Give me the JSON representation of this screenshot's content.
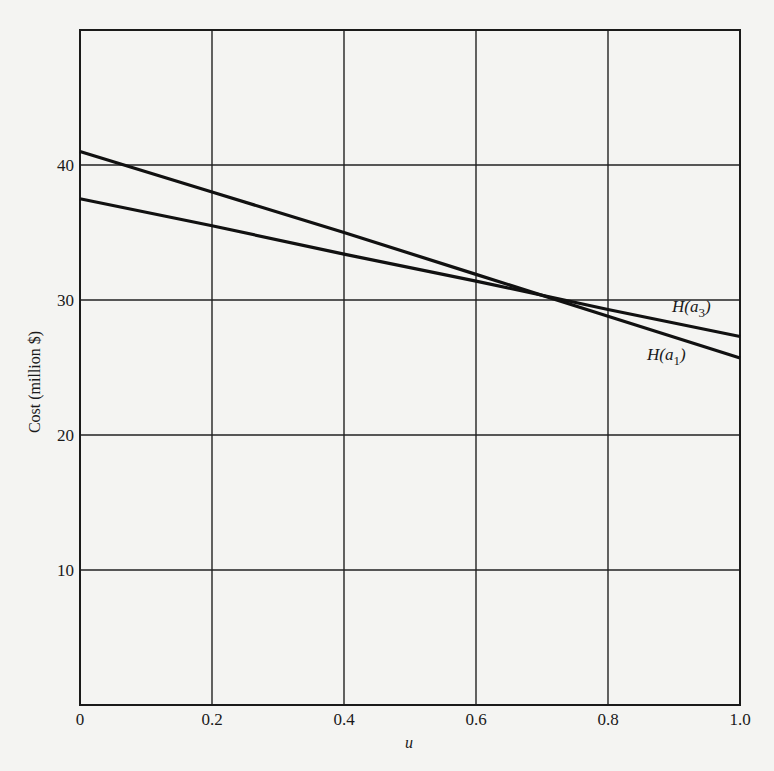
{
  "chart_data": {
    "type": "line",
    "title": "",
    "xlabel": "u",
    "ylabel": "Cost (million $)",
    "xlim": [
      0,
      1.0
    ],
    "ylim": [
      0,
      50
    ],
    "grid": true,
    "x_ticks": [
      "0",
      "0.2",
      "0.4",
      "0.6",
      "0.8",
      "1.0"
    ],
    "y_ticks": [
      "10",
      "20",
      "30",
      "40"
    ],
    "x": [
      0,
      0.2,
      0.4,
      0.6,
      0.8,
      1.0
    ],
    "series": [
      {
        "name": "H(a1)",
        "label_main": "H(a",
        "label_sub": "1",
        "label_close": ")",
        "values": [
          41.0,
          38.0,
          35.0,
          31.9,
          28.8,
          25.7
        ]
      },
      {
        "name": "H(a3)",
        "label_main": "H(a",
        "label_sub": "3",
        "label_close": ")",
        "values": [
          37.5,
          35.5,
          33.4,
          31.4,
          29.3,
          27.3
        ]
      }
    ],
    "annotations": [
      "H(a3)",
      "H(a1)"
    ],
    "legend_position": "inline, right end of lines"
  }
}
